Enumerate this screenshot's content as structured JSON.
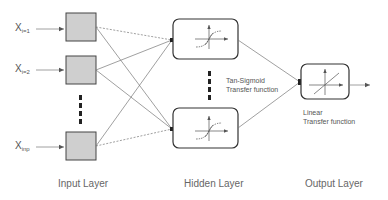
{
  "inputs": [
    {
      "base": "X",
      "sub": "i=1"
    },
    {
      "base": "X",
      "sub": "i=2"
    },
    {
      "base": "X",
      "sub": "inp"
    }
  ],
  "hidden": {
    "function_line1": "Tan-Sigmoid",
    "function_line2": "Transfer function"
  },
  "output": {
    "function_line1": "Linear",
    "function_line2": "Transfer function"
  },
  "layers": {
    "input": "Input Layer",
    "hidden": "Hidden Layer",
    "output": "Output Layer"
  },
  "colors": {
    "input_node_fill": "#cfcfcf",
    "stroke": "#444444",
    "line": "#777777"
  }
}
